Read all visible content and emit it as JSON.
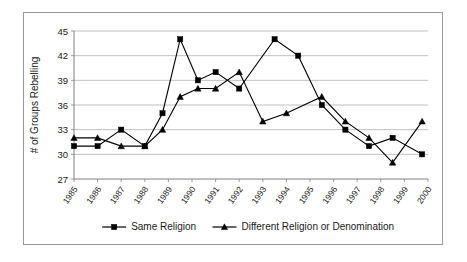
{
  "chart_data": {
    "type": "line",
    "title": "",
    "xlabel": "",
    "ylabel": "# of Groups Rebelling",
    "ylim": [
      27,
      45
    ],
    "yticks": [
      27,
      30,
      33,
      36,
      39,
      42,
      45
    ],
    "grid": true,
    "legend_position": "bottom",
    "xtick_labels": [
      "1985",
      "1986",
      "1987",
      "1988",
      "1989",
      "1990",
      "1991",
      "1992",
      "1993",
      "1994",
      "1995",
      "1996",
      "1997",
      "1998",
      "1999",
      "2000"
    ],
    "x": [
      1985.0,
      1985.5,
      1986.0,
      1986.5,
      1987.0,
      1987.5,
      1988.0,
      1988.5,
      1989.0,
      1989.5,
      1990.0,
      1990.5,
      1991.0,
      1991.5,
      1992.0,
      1992.5,
      1993.0,
      1993.5,
      1994.0,
      1994.5,
      1995.0,
      1995.5,
      1996.0,
      1996.5,
      1997.0,
      1997.5,
      1998.0,
      1998.5,
      1999.0,
      1999.5,
      2000.0
    ],
    "series": [
      {
        "name": "Same Religion",
        "marker": "square",
        "x": [
          1985.0,
          1986.0,
          1987.0,
          1988.0,
          1988.75,
          1989.5,
          1990.25,
          1991.0,
          1992.0,
          1993.5,
          1994.5,
          1995.5,
          1996.5,
          1997.5,
          1998.5,
          1999.75
        ],
        "values": [
          31,
          31,
          33,
          31,
          35,
          44,
          39,
          40,
          38,
          44,
          42,
          36,
          33,
          31,
          32,
          30
        ]
      },
      {
        "name": "Different Religion or Denomination",
        "marker": "triangle",
        "x": [
          1985.0,
          1986.0,
          1987.0,
          1988.0,
          1988.75,
          1989.5,
          1990.25,
          1991.0,
          1992.0,
          1993.0,
          1994.0,
          1995.5,
          1996.5,
          1997.5,
          1998.5,
          1999.75
        ],
        "values": [
          32,
          32,
          31,
          31,
          33,
          37,
          38,
          38,
          40,
          34,
          35,
          37,
          34,
          32,
          29,
          34
        ]
      }
    ]
  },
  "legend": {
    "items": [
      {
        "label": "Same Religion",
        "marker": "square-marker-icon"
      },
      {
        "label": "Different Religion or Denomination",
        "marker": "triangle-marker-icon"
      }
    ]
  },
  "colors": {
    "series": "#000000",
    "grid": "#b0b0b0",
    "axis": "#808080",
    "border": "#9a9a9a",
    "background": "#ffffff",
    "text": "#1a1a1a"
  }
}
